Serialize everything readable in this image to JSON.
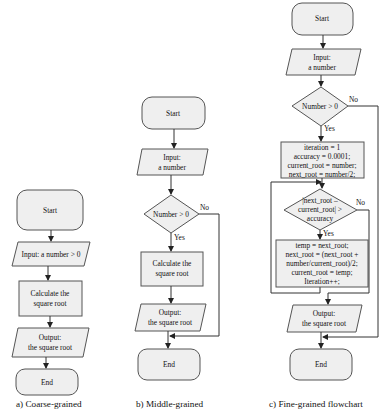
{
  "colors": {
    "fill": "#efefef",
    "stroke": "#555555",
    "line": "#333333",
    "text": "#111111",
    "background": "#ffffff"
  },
  "panel_a": {
    "caption": "a) Coarse-grained",
    "start": "Start",
    "input": "Input: a number > 0",
    "process_line1": "Calculate the",
    "process_line2": "square root",
    "output_line1": "Output:",
    "output_line2": "the square root",
    "end": "End"
  },
  "panel_b": {
    "caption": "b) Middle-grained",
    "start": "Start",
    "input_line1": "Input:",
    "input_line2": "a number",
    "decision": "Number > 0",
    "yes": "Yes",
    "no": "No",
    "process_line1": "Calculate the",
    "process_line2": "square root",
    "output_line1": "Output:",
    "output_line2": "the square root",
    "end": "End"
  },
  "panel_c": {
    "caption": "c) Fine-grained flowchart",
    "start": "Start",
    "input_line1": "Input:",
    "input_line2": "a number",
    "decision": "Number > 0",
    "yes": "Yes",
    "no": "No",
    "init": [
      "iteration = 1",
      "accuracy = 0.0001;",
      "current_root = number;",
      "next_root = number/2;"
    ],
    "loop_decision": [
      "|next_root –",
      "current_root| >",
      "accuracy"
    ],
    "loop_yes": "Yes",
    "loop_no": "No",
    "body": [
      "temp = next_root;",
      "next_root = (next_root +",
      "number/current_root)/2;",
      "current_root = temp;",
      "Iteration++;"
    ],
    "output_line1": "Output:",
    "output_line2": "the square root",
    "end": "End"
  }
}
